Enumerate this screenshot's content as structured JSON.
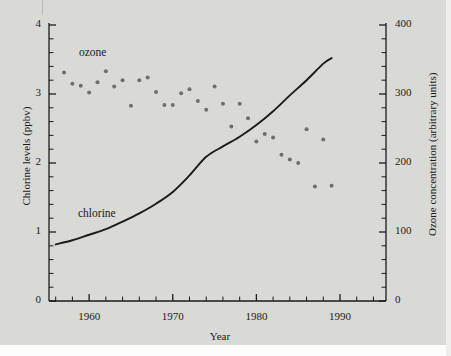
{
  "figure": {
    "background_color": "#d9d9d6",
    "ink_color": "#1b1b1b",
    "point_color": "#6f6f72"
  },
  "chart_data": {
    "type": "scatter",
    "title": "",
    "xlabel": "Year",
    "ylabel": "Chlorine levels (ppbv)",
    "y2label": "Ozone concentration (arbitrary units)",
    "xlim": [
      1955.2,
      1995.5
    ],
    "ylim": [
      0,
      4
    ],
    "y2lim": [
      0,
      400
    ],
    "grid": false,
    "legend_position": "inline-annotations",
    "x_ticks_major": [
      1960,
      1970,
      1980,
      1990
    ],
    "x_ticks_major_labels": [
      "1960",
      "1970",
      "1980",
      "1990"
    ],
    "x_tick_minor_step": 2,
    "y_ticks_major": [
      0,
      1,
      2,
      3,
      4
    ],
    "y_ticks_major_labels": [
      "0",
      "1",
      "2",
      "3",
      "4"
    ],
    "y_tick_minor_step": 0.2,
    "y2_ticks_major": [
      0,
      100,
      200,
      300,
      400
    ],
    "y2_ticks_major_labels": [
      "0",
      "100",
      "200",
      "300",
      "400"
    ],
    "y2_tick_minor_step": 20,
    "series": [
      {
        "name": "ozone",
        "label": "ozone",
        "type": "scatter",
        "axis": "right",
        "marker": "circle",
        "units": "arbitrary units",
        "x": [
          1957,
          1958,
          1959,
          1960,
          1961,
          1962,
          1963,
          1964,
          1965,
          1966,
          1967,
          1968,
          1969,
          1970,
          1971,
          1972,
          1973,
          1974,
          1975,
          1976,
          1977,
          1978,
          1979,
          1980,
          1981,
          1982,
          1983,
          1984,
          1985,
          1986,
          1987,
          1988,
          1989
        ],
        "y": [
          331,
          315,
          312,
          302,
          317,
          333,
          311,
          320,
          283,
          320,
          324,
          303,
          284,
          284,
          301,
          307,
          290,
          277,
          311,
          286,
          253,
          286,
          265,
          231,
          242,
          237,
          212,
          205,
          200,
          249,
          166,
          234,
          167
        ]
      },
      {
        "name": "chlorine",
        "label": "chlorine",
        "type": "line",
        "axis": "left",
        "units": "ppbv",
        "x": [
          1956,
          1958,
          1960,
          1962,
          1964,
          1966,
          1968,
          1970,
          1972,
          1974,
          1976,
          1978,
          1980,
          1982,
          1984,
          1986,
          1988,
          1989
        ],
        "y": [
          0.82,
          0.88,
          0.96,
          1.04,
          1.15,
          1.27,
          1.41,
          1.58,
          1.82,
          2.09,
          2.24,
          2.38,
          2.55,
          2.75,
          2.98,
          3.2,
          3.44,
          3.52
        ]
      }
    ],
    "annotations": [
      {
        "text": "ozone",
        "x": 1959.0,
        "y": 3.62
      },
      {
        "text": "chlorine",
        "x": 1958.8,
        "y": 1.24
      }
    ]
  }
}
